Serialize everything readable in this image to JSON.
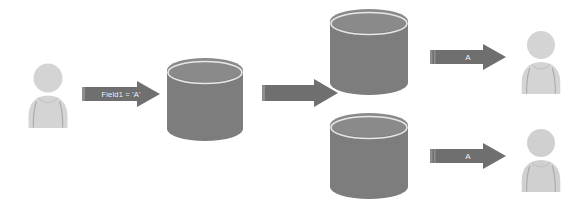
{
  "diagram": {
    "background": "#ffffff",
    "colors": {
      "arrow_fill": "#6f6f6f",
      "arrow_tail_highlight": "#8e8e8e",
      "cylinder_body": "#7d7d7d",
      "cylinder_top": "#8a8a8a",
      "cylinder_rim": "#e4e4e4",
      "person_fill": "#d2d2d2",
      "person_stroke": "#a9a9a9",
      "label_text": "#ffffff"
    },
    "nodes": {
      "writer_user": {
        "name": "user",
        "label": ""
      },
      "primary_db": {
        "name": "database",
        "label": ""
      },
      "replica_db_top": {
        "name": "database",
        "label": ""
      },
      "replica_db_bottom": {
        "name": "database",
        "label": ""
      },
      "reader_user_top": {
        "name": "user",
        "label": ""
      },
      "reader_user_bottom": {
        "name": "user",
        "label": ""
      }
    },
    "arrows": {
      "write": {
        "label": "Field1 = 'A'",
        "direction": "right"
      },
      "replicate": {
        "label": "",
        "direction": "right"
      },
      "read_top": {
        "label": "A",
        "direction": "right"
      },
      "read_bottom": {
        "label": "A",
        "direction": "right"
      }
    }
  }
}
